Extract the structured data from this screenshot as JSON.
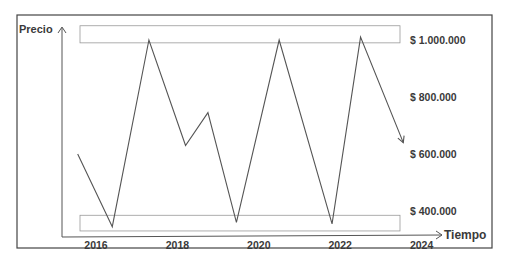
{
  "chart_data": {
    "type": "line",
    "title": "",
    "xlabel": "Tiempo",
    "ylabel": "Precio",
    "x_ticks": [
      "2016",
      "2018",
      "2020",
      "2022",
      "2024"
    ],
    "y_ticks": [
      "$ 1.000.000",
      "$ 800.000",
      "$ 600.000",
      "$ 400.000"
    ],
    "y_tick_values": [
      1000000,
      800000,
      600000,
      400000
    ],
    "x_tick_values": [
      2016,
      2018,
      2020,
      2022,
      2024
    ],
    "xlim": [
      2015.55,
      2024
    ],
    "ylim": [
      340000,
      1100000
    ],
    "series": [
      {
        "name": "Precio",
        "x": [
          2015.55,
          2016.4,
          2017.3,
          2018.2,
          2018.75,
          2019.45,
          2020.5,
          2021.8,
          2022.5,
          2023.55
        ],
        "y": [
          600000,
          345000,
          1000000,
          630000,
          745000,
          360000,
          1000000,
          355000,
          1010000,
          640000
        ]
      }
    ],
    "bands": [
      {
        "name": "resistance-band",
        "y_range": [
          990000,
          1050000
        ]
      },
      {
        "name": "support-band",
        "y_range": [
          330000,
          385000
        ]
      }
    ],
    "grid": false,
    "legend": "none"
  }
}
